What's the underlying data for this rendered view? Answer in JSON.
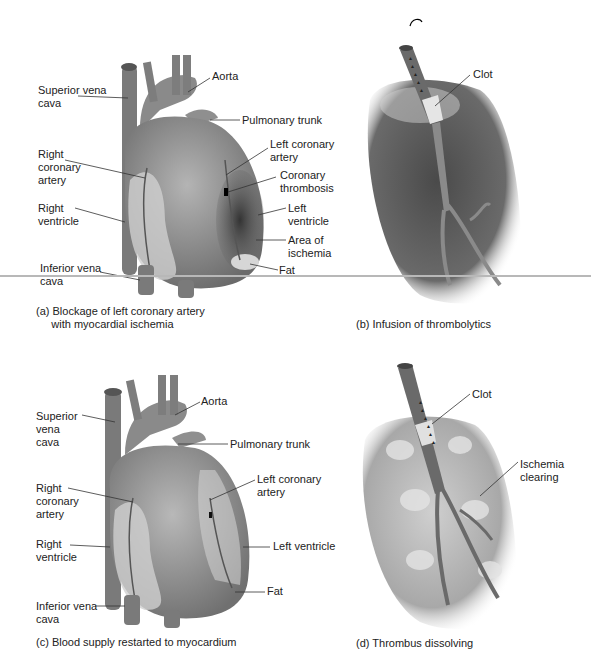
{
  "figure": {
    "colors": {
      "background": "#ffffff",
      "tissue_dark": "#3a3a3a",
      "tissue_mid": "#8a8a8a",
      "tissue_light": "#c8c8c8",
      "fat": "#dcdcdc",
      "divider": "#b8b8b8"
    },
    "panels": [
      {
        "id": "a",
        "caption": "(a) Blockage of left coronary artery\n     with myocardial ischemia",
        "labels": [
          "Superior vena\ncava",
          "Aorta",
          "Pulmonary trunk",
          "Right\ncoronary\nartery",
          "Left coronary\nartery",
          "Coronary\nthrombosis",
          "Right\nventricle",
          "Left\nventricle",
          "Area of\nischemia",
          "Inferior vena\ncava",
          "Fat"
        ]
      },
      {
        "id": "b",
        "caption": "(b) Infusion of thrombolytics",
        "labels": [
          "Clot"
        ]
      },
      {
        "id": "c",
        "caption": "(c) Blood supply restarted to myocardium",
        "labels": [
          "Superior\nvena\ncava",
          "Aorta",
          "Pulmonary trunk",
          "Right\ncoronary\nartery",
          "Left coronary\nartery",
          "Right\nventricle",
          "Left ventricle",
          "Inferior vena\ncava",
          "Fat"
        ]
      },
      {
        "id": "d",
        "caption": "(d) Thrombus dissolving",
        "labels": [
          "Clot",
          "Ischemia\nclearing"
        ]
      }
    ]
  }
}
